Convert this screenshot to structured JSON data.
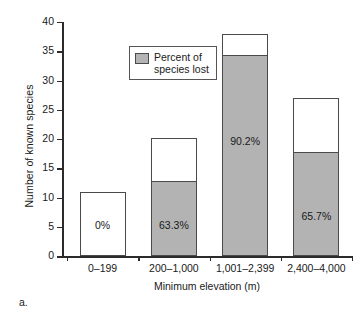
{
  "panel": {
    "letter": "a."
  },
  "legend": {
    "swatch_color": "#b3b3b3",
    "label": "Percent of\nspecies lost"
  },
  "chart_data": {
    "type": "bar",
    "subtype": "stacked",
    "title": "",
    "xlabel": "Minimum elevation (m)",
    "ylabel": "Number of known species",
    "categories": [
      "0–199",
      "200–1,000",
      "1,001–2,399",
      "2,400–4,000"
    ],
    "ylim": [
      0,
      40
    ],
    "yticks": [
      0,
      5,
      10,
      15,
      20,
      25,
      30,
      35,
      40
    ],
    "ytick_labels": [
      "0",
      "5",
      "10",
      "15",
      "20",
      "25",
      "30",
      "35",
      "40"
    ],
    "grid": false,
    "legend_position": "upper-left-inside",
    "series": [
      {
        "name": "Species lost",
        "color": "#b3b3b3",
        "values": [
          0,
          12.8,
          34.4,
          17.8
        ]
      },
      {
        "name": "Species remaining",
        "color": "#ffffff",
        "values": [
          10.9,
          7.4,
          3.5,
          9.2
        ]
      }
    ],
    "totals": [
      10.9,
      20.2,
      37.9,
      27.0
    ],
    "annotations": [
      "0%",
      "63.3%",
      "90.2%",
      "65.7%"
    ],
    "annotation_values": [
      0,
      63.3,
      90.2,
      65.7
    ]
  }
}
